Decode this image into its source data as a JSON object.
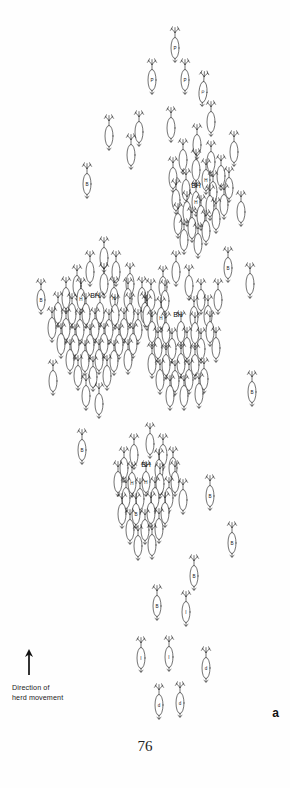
{
  "figure": {
    "panel_label": "a",
    "page_number": "76",
    "legend": {
      "icon": "up-arrow-icon",
      "text": "Direction of\nherd movement"
    },
    "canvas": {
      "width": 290,
      "height": 788
    },
    "symbol": {
      "name": "caribou-symbol",
      "description": "overhead caribou outline with antlers, oval body and tail"
    },
    "label_keys": {
      "BH": "BH",
      "B": "B",
      "I": "I",
      "P": "P",
      "H": "H",
      "blank": ""
    }
  },
  "chart_data": {
    "type": "scatter",
    "title": "",
    "xlabel": "",
    "ylabel": "",
    "cluster_labels": [
      {
        "text": "BH",
        "x": 196,
        "y": 188
      },
      {
        "text": "BH",
        "x": 95,
        "y": 298
      },
      {
        "text": "BH",
        "x": 178,
        "y": 317
      },
      {
        "text": "BH",
        "x": 146,
        "y": 467
      }
    ],
    "animals": [
      {
        "x": 175,
        "y": 48,
        "label": "P",
        "rot": 0
      },
      {
        "x": 152,
        "y": 80,
        "label": "P",
        "rot": 0
      },
      {
        "x": 185,
        "y": 80,
        "label": "P",
        "rot": 0
      },
      {
        "x": 203,
        "y": 92,
        "label": "P",
        "rot": 4
      },
      {
        "x": 211,
        "y": 122,
        "label": "",
        "rot": 0
      },
      {
        "x": 139,
        "y": 132,
        "label": "",
        "rot": 0
      },
      {
        "x": 171,
        "y": 128,
        "label": "",
        "rot": 0
      },
      {
        "x": 109,
        "y": 136,
        "label": "",
        "rot": 0
      },
      {
        "x": 197,
        "y": 145,
        "label": "",
        "rot": 0
      },
      {
        "x": 131,
        "y": 155,
        "label": "",
        "rot": 0
      },
      {
        "x": 234,
        "y": 152,
        "label": "",
        "rot": 0
      },
      {
        "x": 183,
        "y": 160,
        "label": "",
        "rot": 0
      },
      {
        "x": 211,
        "y": 162,
        "label": "",
        "rot": 0
      },
      {
        "x": 87,
        "y": 184,
        "label": "B",
        "rot": 0
      },
      {
        "x": 196,
        "y": 170,
        "label": "",
        "rot": 0
      },
      {
        "x": 173,
        "y": 178,
        "label": "",
        "rot": 0
      },
      {
        "x": 206,
        "y": 180,
        "label": "H",
        "rot": 0
      },
      {
        "x": 221,
        "y": 176,
        "label": "",
        "rot": 0
      },
      {
        "x": 186,
        "y": 190,
        "label": "",
        "rot": 0
      },
      {
        "x": 213,
        "y": 192,
        "label": "",
        "rot": 0
      },
      {
        "x": 229,
        "y": 188,
        "label": "",
        "rot": 0
      },
      {
        "x": 176,
        "y": 200,
        "label": "",
        "rot": 0
      },
      {
        "x": 196,
        "y": 202,
        "label": "H",
        "rot": 0
      },
      {
        "x": 210,
        "y": 206,
        "label": "",
        "rot": 0
      },
      {
        "x": 224,
        "y": 205,
        "label": "",
        "rot": 0
      },
      {
        "x": 187,
        "y": 212,
        "label": "",
        "rot": 0
      },
      {
        "x": 201,
        "y": 216,
        "label": "",
        "rot": 0
      },
      {
        "x": 216,
        "y": 219,
        "label": "",
        "rot": 0
      },
      {
        "x": 178,
        "y": 224,
        "label": "",
        "rot": 0
      },
      {
        "x": 192,
        "y": 228,
        "label": "",
        "rot": 0
      },
      {
        "x": 206,
        "y": 231,
        "label": "",
        "rot": 0
      },
      {
        "x": 184,
        "y": 240,
        "label": "",
        "rot": 0
      },
      {
        "x": 198,
        "y": 244,
        "label": "",
        "rot": 0
      },
      {
        "x": 241,
        "y": 212,
        "label": "",
        "rot": 0
      },
      {
        "x": 250,
        "y": 284,
        "label": "",
        "rot": 0
      },
      {
        "x": 228,
        "y": 268,
        "label": "B",
        "rot": 0
      },
      {
        "x": 218,
        "y": 300,
        "label": "",
        "rot": 0
      },
      {
        "x": 41,
        "y": 300,
        "label": "B",
        "rot": 0
      },
      {
        "x": 104,
        "y": 258,
        "label": "",
        "rot": 0
      },
      {
        "x": 90,
        "y": 272,
        "label": "",
        "rot": 0
      },
      {
        "x": 116,
        "y": 272,
        "label": "",
        "rot": 0
      },
      {
        "x": 77,
        "y": 286,
        "label": "",
        "rot": 0
      },
      {
        "x": 104,
        "y": 284,
        "label": "",
        "rot": 0
      },
      {
        "x": 130,
        "y": 284,
        "label": "",
        "rot": 0
      },
      {
        "x": 66,
        "y": 298,
        "label": "",
        "rot": 0
      },
      {
        "x": 81,
        "y": 299,
        "label": "H",
        "rot": 0
      },
      {
        "x": 114,
        "y": 298,
        "label": "H",
        "rot": 0
      },
      {
        "x": 128,
        "y": 299,
        "label": "",
        "rot": 0
      },
      {
        "x": 142,
        "y": 298,
        "label": "",
        "rot": 0
      },
      {
        "x": 58,
        "y": 313,
        "label": "",
        "rot": 0
      },
      {
        "x": 72,
        "y": 314,
        "label": "",
        "rot": 0
      },
      {
        "x": 86,
        "y": 314,
        "label": "",
        "rot": 0
      },
      {
        "x": 100,
        "y": 313,
        "label": "",
        "rot": 0
      },
      {
        "x": 115,
        "y": 315,
        "label": "",
        "rot": 0
      },
      {
        "x": 130,
        "y": 314,
        "label": "",
        "rot": 0
      },
      {
        "x": 145,
        "y": 313,
        "label": "",
        "rot": 0
      },
      {
        "x": 52,
        "y": 328,
        "label": "",
        "rot": 0
      },
      {
        "x": 66,
        "y": 329,
        "label": "",
        "rot": 0
      },
      {
        "x": 80,
        "y": 330,
        "label": "",
        "rot": 0
      },
      {
        "x": 95,
        "y": 329,
        "label": "",
        "rot": 0
      },
      {
        "x": 109,
        "y": 330,
        "label": "",
        "rot": 0
      },
      {
        "x": 124,
        "y": 329,
        "label": "",
        "rot": 0
      },
      {
        "x": 138,
        "y": 330,
        "label": "",
        "rot": 0
      },
      {
        "x": 61,
        "y": 344,
        "label": "",
        "rot": 0
      },
      {
        "x": 75,
        "y": 345,
        "label": "",
        "rot": 0
      },
      {
        "x": 90,
        "y": 345,
        "label": "",
        "rot": 0
      },
      {
        "x": 104,
        "y": 344,
        "label": "",
        "rot": 0
      },
      {
        "x": 119,
        "y": 345,
        "label": "",
        "rot": 0
      },
      {
        "x": 133,
        "y": 344,
        "label": "",
        "rot": 0
      },
      {
        "x": 70,
        "y": 360,
        "label": "",
        "rot": 0
      },
      {
        "x": 85,
        "y": 361,
        "label": "",
        "rot": 0
      },
      {
        "x": 99,
        "y": 360,
        "label": "",
        "rot": 0
      },
      {
        "x": 114,
        "y": 361,
        "label": "",
        "rot": 0
      },
      {
        "x": 128,
        "y": 360,
        "label": "",
        "rot": 0
      },
      {
        "x": 78,
        "y": 376,
        "label": "",
        "rot": 0
      },
      {
        "x": 93,
        "y": 377,
        "label": "",
        "rot": 0
      },
      {
        "x": 107,
        "y": 376,
        "label": "",
        "rot": 0
      },
      {
        "x": 53,
        "y": 381,
        "label": "",
        "rot": 0
      },
      {
        "x": 176,
        "y": 272,
        "label": "",
        "rot": 0
      },
      {
        "x": 163,
        "y": 287,
        "label": "",
        "rot": 0
      },
      {
        "x": 189,
        "y": 286,
        "label": "",
        "rot": 0
      },
      {
        "x": 151,
        "y": 300,
        "label": "",
        "rot": 0
      },
      {
        "x": 165,
        "y": 301,
        "label": "",
        "rot": 0
      },
      {
        "x": 201,
        "y": 300,
        "label": "",
        "rot": 0
      },
      {
        "x": 147,
        "y": 316,
        "label": "",
        "rot": 0
      },
      {
        "x": 161,
        "y": 318,
        "label": "H",
        "rot": 0
      },
      {
        "x": 194,
        "y": 317,
        "label": "",
        "rot": 0
      },
      {
        "x": 208,
        "y": 316,
        "label": "",
        "rot": 0
      },
      {
        "x": 152,
        "y": 332,
        "label": "",
        "rot": 0
      },
      {
        "x": 166,
        "y": 333,
        "label": "",
        "rot": 0
      },
      {
        "x": 181,
        "y": 332,
        "label": "",
        "rot": 0
      },
      {
        "x": 195,
        "y": 333,
        "label": "",
        "rot": 0
      },
      {
        "x": 210,
        "y": 332,
        "label": "",
        "rot": 0
      },
      {
        "x": 158,
        "y": 348,
        "label": "",
        "rot": 0
      },
      {
        "x": 172,
        "y": 349,
        "label": "",
        "rot": 0
      },
      {
        "x": 187,
        "y": 348,
        "label": "",
        "rot": 0
      },
      {
        "x": 201,
        "y": 349,
        "label": "",
        "rot": 0
      },
      {
        "x": 216,
        "y": 348,
        "label": "",
        "rot": 0
      },
      {
        "x": 152,
        "y": 364,
        "label": "",
        "rot": 0
      },
      {
        "x": 166,
        "y": 365,
        "label": "",
        "rot": 0
      },
      {
        "x": 181,
        "y": 364,
        "label": "",
        "rot": 0
      },
      {
        "x": 195,
        "y": 365,
        "label": "",
        "rot": 0
      },
      {
        "x": 160,
        "y": 380,
        "label": "",
        "rot": 0
      },
      {
        "x": 175,
        "y": 381,
        "label": "",
        "rot": 0
      },
      {
        "x": 189,
        "y": 380,
        "label": "",
        "rot": 0
      },
      {
        "x": 204,
        "y": 379,
        "label": "",
        "rot": 0
      },
      {
        "x": 170,
        "y": 396,
        "label": "",
        "rot": 0
      },
      {
        "x": 184,
        "y": 396,
        "label": "",
        "rot": 0
      },
      {
        "x": 199,
        "y": 394,
        "label": "",
        "rot": 0
      },
      {
        "x": 252,
        "y": 392,
        "label": "B",
        "rot": 0
      },
      {
        "x": 86,
        "y": 396,
        "label": "",
        "rot": 0
      },
      {
        "x": 99,
        "y": 404,
        "label": "",
        "rot": 0
      },
      {
        "x": 82,
        "y": 450,
        "label": "B",
        "rot": 0
      },
      {
        "x": 150,
        "y": 444,
        "label": "",
        "rot": 0
      },
      {
        "x": 134,
        "y": 455,
        "label": "",
        "rot": 0
      },
      {
        "x": 163,
        "y": 455,
        "label": "",
        "rot": 0
      },
      {
        "x": 124,
        "y": 468,
        "label": "",
        "rot": 0
      },
      {
        "x": 159,
        "y": 470,
        "label": "",
        "rot": 0
      },
      {
        "x": 173,
        "y": 468,
        "label": "",
        "rot": 0
      },
      {
        "x": 118,
        "y": 482,
        "label": "",
        "rot": 0
      },
      {
        "x": 132,
        "y": 483,
        "label": "H",
        "rot": 0
      },
      {
        "x": 146,
        "y": 482,
        "label": "H",
        "rot": 0
      },
      {
        "x": 160,
        "y": 484,
        "label": "",
        "rot": 0
      },
      {
        "x": 175,
        "y": 482,
        "label": "",
        "rot": 0
      },
      {
        "x": 126,
        "y": 498,
        "label": "",
        "rot": 0
      },
      {
        "x": 140,
        "y": 499,
        "label": "",
        "rot": 0
      },
      {
        "x": 155,
        "y": 498,
        "label": "",
        "rot": 0
      },
      {
        "x": 169,
        "y": 498,
        "label": "",
        "rot": 0
      },
      {
        "x": 122,
        "y": 514,
        "label": "",
        "rot": 0
      },
      {
        "x": 136,
        "y": 514,
        "label": "B",
        "rot": 0
      },
      {
        "x": 151,
        "y": 513,
        "label": "",
        "rot": 0
      },
      {
        "x": 165,
        "y": 513,
        "label": "",
        "rot": 0
      },
      {
        "x": 130,
        "y": 530,
        "label": "",
        "rot": 0
      },
      {
        "x": 145,
        "y": 530,
        "label": "",
        "rot": 0
      },
      {
        "x": 159,
        "y": 529,
        "label": "",
        "rot": 0
      },
      {
        "x": 138,
        "y": 546,
        "label": "",
        "rot": 0
      },
      {
        "x": 152,
        "y": 545,
        "label": "",
        "rot": 0
      },
      {
        "x": 183,
        "y": 500,
        "label": "",
        "rot": 0
      },
      {
        "x": 210,
        "y": 496,
        "label": "B",
        "rot": 0
      },
      {
        "x": 232,
        "y": 543,
        "label": "B",
        "rot": 0
      },
      {
        "x": 194,
        "y": 576,
        "label": "B",
        "rot": 0
      },
      {
        "x": 157,
        "y": 606,
        "label": "B",
        "rot": 0
      },
      {
        "x": 186,
        "y": 612,
        "label": "I",
        "rot": 0
      },
      {
        "x": 141,
        "y": 658,
        "label": "I",
        "rot": 0
      },
      {
        "x": 169,
        "y": 657,
        "label": "I",
        "rot": 0
      },
      {
        "x": 206,
        "y": 668,
        "label": "d",
        "rot": 0
      },
      {
        "x": 159,
        "y": 705,
        "label": "d",
        "rot": 0
      },
      {
        "x": 180,
        "y": 703,
        "label": "d",
        "rot": 0
      }
    ]
  }
}
